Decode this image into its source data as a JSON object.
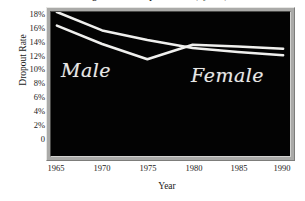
{
  "chart_data": {
    "type": "line",
    "title": "High School Dropout Rates (by Sex)",
    "xlabel": "Year",
    "ylabel": "Dropout Rate",
    "x": [
      1965,
      1970,
      1975,
      1980,
      1985,
      1990
    ],
    "xlim": [
      1965,
      1990
    ],
    "ylim": [
      0,
      18
    ],
    "xticks": [
      "1965",
      "1970",
      "1975",
      "1980",
      "1985",
      "1990"
    ],
    "yticks": [
      "18%",
      "16%",
      "14%",
      "12%",
      "10%",
      "8%",
      "6%",
      "4%",
      "2%",
      "0"
    ],
    "ytick_values": [
      18,
      16,
      14,
      12,
      10,
      8,
      6,
      4,
      2,
      0
    ],
    "grid": false,
    "legend": "inline-annotations",
    "background": "#030303",
    "line_color": "#f0f0ee",
    "series": [
      {
        "name": "Male",
        "values": [
          18.0,
          15.7,
          14.5,
          13.5,
          13.0,
          12.6
        ]
      },
      {
        "name": "Female",
        "values": [
          16.3,
          14.0,
          12.1,
          13.9,
          13.7,
          13.4
        ]
      }
    ],
    "annotations": [
      {
        "text": "Male",
        "x": 1967,
        "y": 11.0
      },
      {
        "text": "Female",
        "x": 1983,
        "y": 10.5
      }
    ]
  }
}
